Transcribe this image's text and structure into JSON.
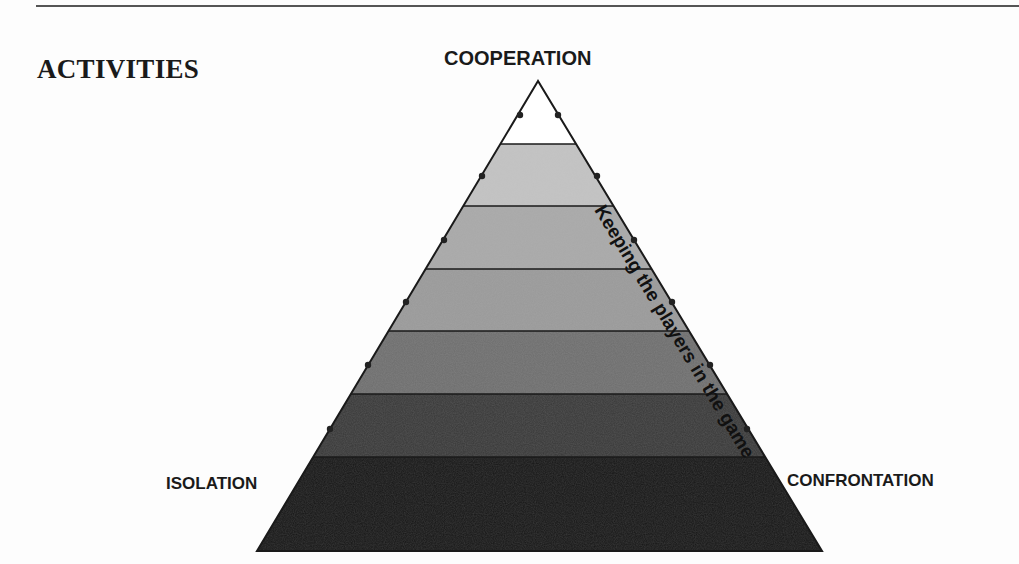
{
  "heading": "ACTIVITIES",
  "diagram": {
    "type": "pyramid",
    "apex_label": "COOPERATION",
    "bottom_left_label": "ISOLATION",
    "bottom_right_label": "CONFRONTATION",
    "left_edge_text": "Bringing players into the game",
    "right_edge_text": "Keeping the players in the game",
    "bands": [
      {
        "index": 1,
        "fill": "#ffffff"
      },
      {
        "index": 2,
        "fill": "#c4c4c4"
      },
      {
        "index": 3,
        "fill": "#a9a9a9"
      },
      {
        "index": 4,
        "fill": "#9a9a9a"
      },
      {
        "index": 5,
        "fill": "#6e6e6e"
      },
      {
        "index": 6,
        "fill": "#383838"
      },
      {
        "index": 7,
        "fill": "#161616"
      }
    ],
    "edge_dots_per_side": 6
  }
}
